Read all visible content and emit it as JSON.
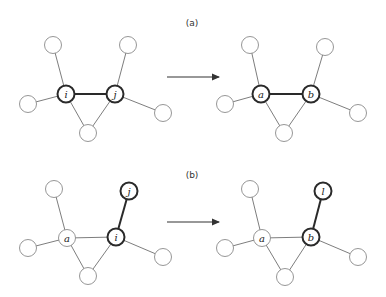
{
  "figure": {
    "width": 386,
    "height": 297,
    "colors": {
      "background": "#ffffff",
      "node_stroke": "#8a8a8a",
      "bold_stroke": "#2a2a2a",
      "edge": "#6e6e6e",
      "text": "#222222"
    },
    "node_radius": 8.5,
    "panels": [
      {
        "label": "(a)",
        "label_pos": [
          192,
          26
        ],
        "arrow": {
          "from": [
            167,
            77
          ],
          "to": [
            219,
            77
          ]
        },
        "graphs": [
          {
            "name": "before",
            "nodes": [
              {
                "id": "tl",
                "x": 53,
                "y": 45,
                "label": "",
                "bold": false
              },
              {
                "id": "i",
                "x": 66,
                "y": 94,
                "label": "i",
                "bold": true
              },
              {
                "id": "j",
                "x": 115,
                "y": 94,
                "label": "j",
                "bold": true
              },
              {
                "id": "l",
                "x": 28,
                "y": 104,
                "label": "",
                "bold": false
              },
              {
                "id": "bot",
                "x": 88,
                "y": 133,
                "label": "",
                "bold": false
              },
              {
                "id": "tr",
                "x": 128,
                "y": 45,
                "label": "",
                "bold": false
              },
              {
                "id": "r",
                "x": 163,
                "y": 113,
                "label": "",
                "bold": false
              }
            ],
            "edges": [
              {
                "from": "tl",
                "to": "i",
                "bold": false
              },
              {
                "from": "l",
                "to": "i",
                "bold": false
              },
              {
                "from": "i",
                "to": "j",
                "bold": true
              },
              {
                "from": "i",
                "to": "bot",
                "bold": false
              },
              {
                "from": "j",
                "to": "bot",
                "bold": false
              },
              {
                "from": "tr",
                "to": "j",
                "bold": false
              },
              {
                "from": "j",
                "to": "r",
                "bold": false
              }
            ]
          },
          {
            "name": "after",
            "nodes": [
              {
                "id": "tl",
                "x": 250,
                "y": 45,
                "label": "",
                "bold": false
              },
              {
                "id": "a",
                "x": 261,
                "y": 94,
                "label": "a",
                "bold": true
              },
              {
                "id": "b",
                "x": 311,
                "y": 94,
                "label": "b",
                "bold": true
              },
              {
                "id": "l",
                "x": 225,
                "y": 104,
                "label": "",
                "bold": false
              },
              {
                "id": "bot",
                "x": 284,
                "y": 133,
                "label": "",
                "bold": false
              },
              {
                "id": "tr",
                "x": 325,
                "y": 47,
                "label": "",
                "bold": false
              },
              {
                "id": "r",
                "x": 358,
                "y": 113,
                "label": "",
                "bold": false
              }
            ],
            "edges": [
              {
                "from": "tl",
                "to": "a",
                "bold": false
              },
              {
                "from": "l",
                "to": "a",
                "bold": false
              },
              {
                "from": "a",
                "to": "b",
                "bold": true
              },
              {
                "from": "a",
                "to": "bot",
                "bold": false
              },
              {
                "from": "b",
                "to": "bot",
                "bold": false
              },
              {
                "from": "tr",
                "to": "b",
                "bold": false
              },
              {
                "from": "b",
                "to": "r",
                "bold": false
              }
            ]
          }
        ]
      },
      {
        "label": "(b)",
        "label_pos": [
          192,
          178
        ],
        "arrow": {
          "from": [
            167,
            222
          ],
          "to": [
            219,
            222
          ]
        },
        "graphs": [
          {
            "name": "before",
            "nodes": [
              {
                "id": "tl",
                "x": 54,
                "y": 189,
                "label": "",
                "bold": false
              },
              {
                "id": "j",
                "x": 129,
                "y": 191,
                "label": "j",
                "bold": true
              },
              {
                "id": "a",
                "x": 67,
                "y": 238,
                "label": "a",
                "bold": false
              },
              {
                "id": "i",
                "x": 116,
                "y": 237,
                "label": "i",
                "bold": true
              },
              {
                "id": "l",
                "x": 28,
                "y": 248,
                "label": "",
                "bold": false
              },
              {
                "id": "bot",
                "x": 88,
                "y": 276,
                "label": "",
                "bold": false
              },
              {
                "id": "r",
                "x": 163,
                "y": 257,
                "label": "",
                "bold": false
              }
            ],
            "edges": [
              {
                "from": "tl",
                "to": "a",
                "bold": false
              },
              {
                "from": "l",
                "to": "a",
                "bold": false
              },
              {
                "from": "a",
                "to": "i",
                "bold": false
              },
              {
                "from": "a",
                "to": "bot",
                "bold": false
              },
              {
                "from": "i",
                "to": "bot",
                "bold": false
              },
              {
                "from": "j",
                "to": "i",
                "bold": true
              },
              {
                "from": "i",
                "to": "r",
                "bold": false
              }
            ]
          },
          {
            "name": "after",
            "nodes": [
              {
                "id": "tl",
                "x": 250,
                "y": 189,
                "label": "",
                "bold": false
              },
              {
                "id": "l2",
                "x": 323,
                "y": 191,
                "label": "l",
                "bold": true
              },
              {
                "id": "a",
                "x": 262,
                "y": 238,
                "label": "a",
                "bold": false
              },
              {
                "id": "b",
                "x": 311,
                "y": 237,
                "label": "b",
                "bold": true
              },
              {
                "id": "l",
                "x": 225,
                "y": 248,
                "label": "",
                "bold": false
              },
              {
                "id": "bot",
                "x": 285,
                "y": 277,
                "label": "",
                "bold": false
              },
              {
                "id": "r",
                "x": 358,
                "y": 257,
                "label": "",
                "bold": false
              }
            ],
            "edges": [
              {
                "from": "tl",
                "to": "a",
                "bold": false
              },
              {
                "from": "l",
                "to": "a",
                "bold": false
              },
              {
                "from": "a",
                "to": "b",
                "bold": false
              },
              {
                "from": "a",
                "to": "bot",
                "bold": false
              },
              {
                "from": "b",
                "to": "bot",
                "bold": false
              },
              {
                "from": "l2",
                "to": "b",
                "bold": true
              },
              {
                "from": "b",
                "to": "r",
                "bold": false
              }
            ]
          }
        ]
      }
    ]
  }
}
